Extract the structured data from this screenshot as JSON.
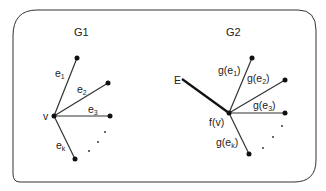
{
  "diagram": {
    "graphs": [
      {
        "id": "G1",
        "label": "G1",
        "center": {
          "label": "v"
        },
        "edges": [
          {
            "name": "e",
            "sub": "1"
          },
          {
            "name": "e",
            "sub": "2"
          },
          {
            "name": "e",
            "sub": "3"
          },
          {
            "name": "e",
            "sub": "k"
          }
        ],
        "ellipsis": "..."
      },
      {
        "id": "G2",
        "label": "G2",
        "center": {
          "label": "f(v)"
        },
        "extra_edge": {
          "label": "E"
        },
        "edges": [
          {
            "prefix": "g(e",
            "sub": "1",
            "suffix": ")"
          },
          {
            "prefix": "g(e",
            "sub": "2",
            "suffix": ")"
          },
          {
            "prefix": "g(e",
            "sub": "3",
            "suffix": ")"
          },
          {
            "prefix": "g(e",
            "sub": "k",
            "suffix": ")"
          }
        ],
        "ellipsis": "..."
      }
    ],
    "colors": {
      "stroke": "#333333",
      "node": "#111111",
      "text": "#222222",
      "background": "#ffffff"
    }
  }
}
